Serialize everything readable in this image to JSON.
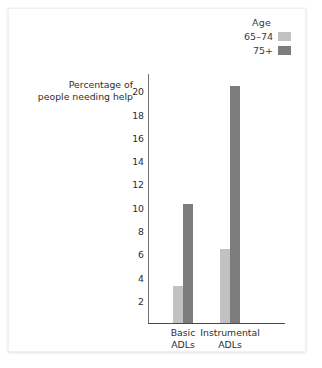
{
  "chart_data": {
    "type": "bar",
    "title": "",
    "xlabel": "",
    "ylabel": "Percentage of people needing help",
    "ylabel_line1": "Percentage of",
    "ylabel_line2": "people needing help",
    "categories": [
      "Basic ADLs",
      "Instrumental ADLs"
    ],
    "category_lines": [
      [
        "Basic",
        "ADLs"
      ],
      [
        "Instrumental",
        "ADLs"
      ]
    ],
    "series": [
      {
        "name": "65–74",
        "values": [
          3.2,
          6.4
        ],
        "color": "#c2c2c2"
      },
      {
        "name": "75+",
        "values": [
          10.2,
          20.4
        ],
        "color": "#7d7d7d"
      }
    ],
    "ylim": [
      0,
      21.5
    ],
    "yticks": [
      2,
      4,
      6,
      8,
      10,
      12,
      14,
      16,
      18,
      20
    ],
    "ytick_labels": [
      "2",
      "4",
      "6",
      "8",
      "10",
      "12",
      "14",
      "16",
      "18",
      "20"
    ],
    "grid": false,
    "legend_position": "top-right"
  },
  "legend": {
    "title": "Age",
    "entries": [
      {
        "label": "65–74",
        "color": "#c2c2c2"
      },
      {
        "label": "75+",
        "color": "#7d7d7d"
      }
    ]
  },
  "colors": {
    "axis": "#4a4a4a",
    "text": "#2e2e2e",
    "card_background": "#ffffff",
    "series_light": "#c2c2c2",
    "series_dark": "#7d7d7d"
  }
}
